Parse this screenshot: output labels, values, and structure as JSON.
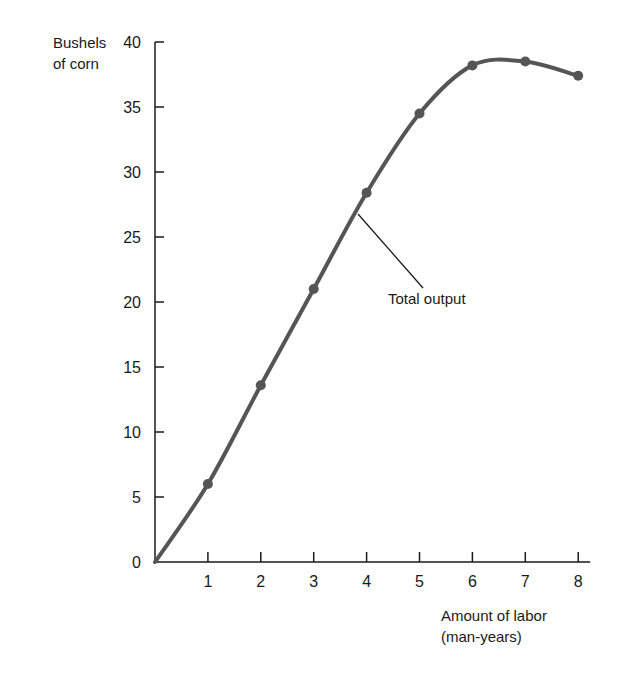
{
  "chart_data": {
    "type": "line",
    "title": "",
    "xlabel": "Amount of labor (man-years)",
    "xlabel_lines": [
      "Amount of labor",
      "(man-years)"
    ],
    "ylabel": "Bushels of corn",
    "ylabel_lines": [
      "Bushels",
      "of corn"
    ],
    "x": [
      0,
      1,
      2,
      3,
      4,
      5,
      6,
      7,
      8
    ],
    "series": [
      {
        "name": "Total output",
        "values": [
          0,
          6,
          13.6,
          21,
          28.4,
          34.5,
          38.2,
          38.5,
          37.4
        ],
        "color": "#555555",
        "markers_at": [
          1,
          2,
          3,
          4,
          5,
          6,
          7,
          8
        ]
      }
    ],
    "xlim": [
      0,
      8
    ],
    "ylim": [
      0,
      40
    ],
    "x_ticks": [
      1,
      2,
      3,
      4,
      5,
      6,
      7,
      8
    ],
    "y_ticks": [
      0,
      5,
      10,
      15,
      20,
      25,
      30,
      35,
      40
    ],
    "grid": false,
    "legend": "none",
    "annotations": [
      {
        "text": "Total output",
        "points_to_x": 3.8
      }
    ]
  }
}
